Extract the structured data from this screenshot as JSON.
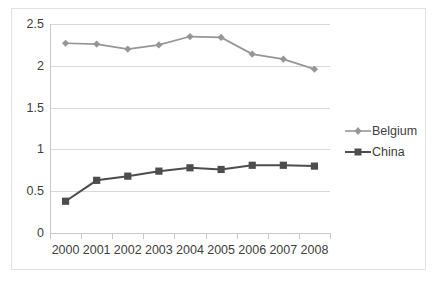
{
  "chart_data": {
    "type": "line",
    "title": "",
    "xlabel": "",
    "ylabel": "",
    "categories": [
      "2000",
      "2001",
      "2002",
      "2003",
      "2004",
      "2005",
      "2006",
      "2007",
      "2008"
    ],
    "ylim": [
      0,
      2.5
    ],
    "ytick_labels": [
      "0",
      "0.5",
      "1",
      "1.5",
      "2",
      "2.5"
    ],
    "ytick_values": [
      0,
      0.5,
      1,
      1.5,
      2,
      2.5
    ],
    "grid": true,
    "legend_position": "right",
    "series": [
      {
        "name": "Belgium",
        "color": "#969696",
        "marker": "diamond",
        "values": [
          2.27,
          2.26,
          2.2,
          2.25,
          2.35,
          2.34,
          2.14,
          2.08,
          1.96
        ]
      },
      {
        "name": "China",
        "color": "#4d4d4d",
        "marker": "square",
        "values": [
          0.38,
          0.63,
          0.68,
          0.74,
          0.78,
          0.76,
          0.81,
          0.81,
          0.8
        ]
      }
    ]
  },
  "legend": {
    "entries": [
      {
        "label": "Belgium"
      },
      {
        "label": "China"
      }
    ]
  },
  "colors": {
    "belgium": "#969696",
    "china": "#4d4d4d",
    "gridline": "#d9d9d9",
    "axis": "#c8c8c8",
    "text": "#404040",
    "frame": "#e2e2e2",
    "background": "#ffffff"
  }
}
